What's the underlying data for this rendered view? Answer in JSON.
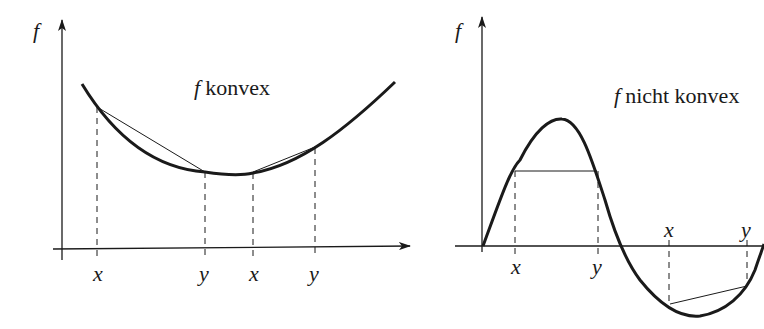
{
  "figures": [
    {
      "id": "convex",
      "axis_label": "f",
      "title_f": "f",
      "title_text": "konvex",
      "ticks": [
        "x",
        "y",
        "x",
        "y"
      ]
    },
    {
      "id": "nonconvex",
      "axis_label": "f",
      "title_f": "f",
      "title_text": "nicht konvex",
      "ticks_below": [
        "x",
        "y"
      ],
      "ticks_above": [
        "x",
        "y"
      ]
    }
  ],
  "colors": {
    "stroke": "#1a1a1a",
    "background": "#ffffff"
  }
}
